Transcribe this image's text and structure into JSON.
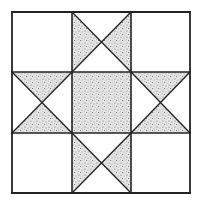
{
  "diagram": {
    "type": "quilt-block",
    "pattern": "ohio-star",
    "grid": {
      "rows": 3,
      "cols": 3
    },
    "colors": {
      "background": "#ffffff",
      "line": "#222222",
      "stipple_base": "#e4e4e4",
      "stipple_dot": "#6a6a6a"
    },
    "bounds": {
      "left": 12,
      "top": 12,
      "right": 190,
      "bottom": 193
    },
    "grid_lines": {
      "x": [
        72,
        131
      ],
      "y": [
        72,
        133
      ]
    },
    "cells": [
      {
        "row": 0,
        "col": 0,
        "kind": "plain"
      },
      {
        "row": 0,
        "col": 1,
        "kind": "hourglass",
        "shaded": [
          "left",
          "right"
        ]
      },
      {
        "row": 0,
        "col": 2,
        "kind": "plain"
      },
      {
        "row": 1,
        "col": 0,
        "kind": "hourglass",
        "shaded": [
          "top",
          "bottom"
        ]
      },
      {
        "row": 1,
        "col": 1,
        "kind": "solid-shaded"
      },
      {
        "row": 1,
        "col": 2,
        "kind": "hourglass",
        "shaded": [
          "top",
          "bottom"
        ]
      },
      {
        "row": 2,
        "col": 0,
        "kind": "plain"
      },
      {
        "row": 2,
        "col": 1,
        "kind": "hourglass",
        "shaded": [
          "left",
          "right"
        ]
      },
      {
        "row": 2,
        "col": 2,
        "kind": "plain"
      }
    ]
  }
}
